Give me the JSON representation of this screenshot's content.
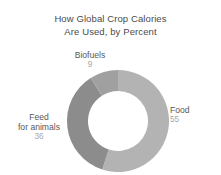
{
  "chart_data": {
    "type": "pie",
    "variant": "donut",
    "title": "How Global Crop Calories Are Used, by Percent",
    "title_line_1": "How Global Crop Calories",
    "title_line_2": "Are Used, by Percent",
    "xlabel": "",
    "ylabel": "",
    "units": "percent",
    "legend_position": "outside-labels",
    "grid": false,
    "categories": [
      "Food",
      "Feed for animals",
      "Biofuels"
    ],
    "values": [
      55,
      36,
      9
    ],
    "slices": [
      {
        "label": "Food",
        "label_line_1": "Food",
        "value": 55,
        "value_text": "55",
        "color": "#b3b3b3",
        "start_angle_deg": 0,
        "end_angle_deg": 198
      },
      {
        "label": "Feed for animals",
        "label_line_1": "Feed",
        "label_line_2": "for animals",
        "value": 36,
        "value_text": "36",
        "color": "#8c8c8c",
        "start_angle_deg": 198,
        "end_angle_deg": 327.6
      },
      {
        "label": "Biofuels",
        "label_line_1": "Biofuels",
        "value": 9,
        "value_text": "9",
        "color": "#a0a0a0",
        "start_angle_deg": 327.6,
        "end_angle_deg": 360
      }
    ],
    "colors": {
      "food": "#b3b3b3",
      "feed": "#8c8c8c",
      "biofuels": "#a0a0a0",
      "title_text": "#4a4a4a",
      "label_text": "#595959",
      "value_text": "#a6a6a6",
      "background": "#ffffff"
    }
  }
}
